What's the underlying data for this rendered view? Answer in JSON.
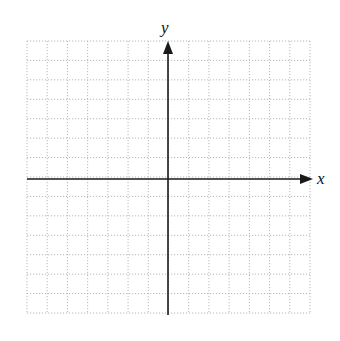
{
  "diagram": {
    "type": "coordinate-plane",
    "x_axis_label": "x",
    "y_axis_label": "y",
    "grid": {
      "columns": 14,
      "rows": 14,
      "left": 27,
      "top": 41,
      "right": 310,
      "bottom": 313,
      "line_color": "#b8b8b8",
      "line_style": "dotted"
    },
    "axes": {
      "origin_x": 168,
      "origin_y": 179,
      "color": "#1a1a1a",
      "x_start": 27,
      "x_end": 313,
      "y_start": 315,
      "y_end": 41
    }
  }
}
